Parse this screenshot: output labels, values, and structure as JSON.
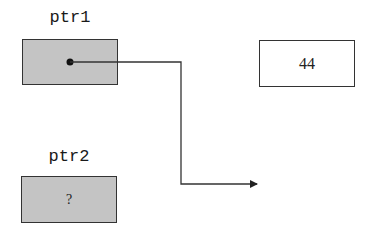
{
  "diagram": {
    "type": "pointer-memory-diagram",
    "variables": [
      {
        "name": "ptr1",
        "kind": "pointer",
        "content": "",
        "points_to": "pointer-arrow-target"
      },
      {
        "name": "ptr2",
        "kind": "pointer",
        "content": "?"
      }
    ],
    "memory_cells": [
      {
        "value": "44"
      }
    ],
    "arrow": {
      "from": "ptr1",
      "to": "empty space (not pointing at 44)"
    },
    "colors": {
      "pointer_fill": "#c4c4c4",
      "value_fill": "#ffffff",
      "stroke": "#333333"
    }
  }
}
